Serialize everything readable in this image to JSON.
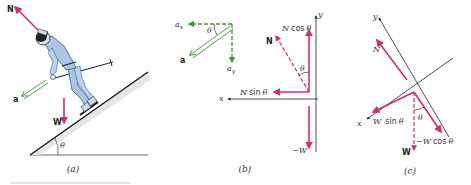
{
  "colors": {
    "force": "#d92a6b",
    "acceleration": "#3c9a2c",
    "axis": "#222222",
    "slope_fill": "#e6e6e6",
    "skier_suit": "#a8c6e6",
    "text": "#222222"
  },
  "panels": [
    {
      "id": "a",
      "caption": "(a)",
      "labels": {
        "normal_force": "N",
        "weight": "W",
        "acceleration": "a",
        "angle": "θ"
      },
      "description": "Skier descending an incline of angle θ; normal force N perpendicular to slope, weight W downward, acceleration a along the slope"
    },
    {
      "id": "b",
      "caption": "(b)",
      "labels": {
        "a_x": "a",
        "a_x_sub": "x",
        "a_y": "a",
        "a_y_sub": "y",
        "a": "a",
        "angle_accel": "θ",
        "normal_force": "N",
        "n_cos": "N cos θ",
        "n_sin": "N sin θ",
        "angle_normal": "θ",
        "neg_weight": "−W",
        "x_axis": "x",
        "y_axis": "y"
      },
      "description": "Horizontal/vertical axes: acceleration resolved into a_x and a_y; normal force resolved into N sin θ and N cos θ; weight −W along −y"
    },
    {
      "id": "c",
      "caption": "(c)",
      "labels": {
        "y_axis": "y",
        "x_axis": "x",
        "normal_force": "N",
        "w_sin": "W sin θ",
        "w_cos": "−W cos θ",
        "weight": "W",
        "angle": "θ"
      },
      "description": "Tilted axes aligned with slope: N along +y, weight W resolved into W sin θ along x and −W cos θ along −y"
    }
  ]
}
